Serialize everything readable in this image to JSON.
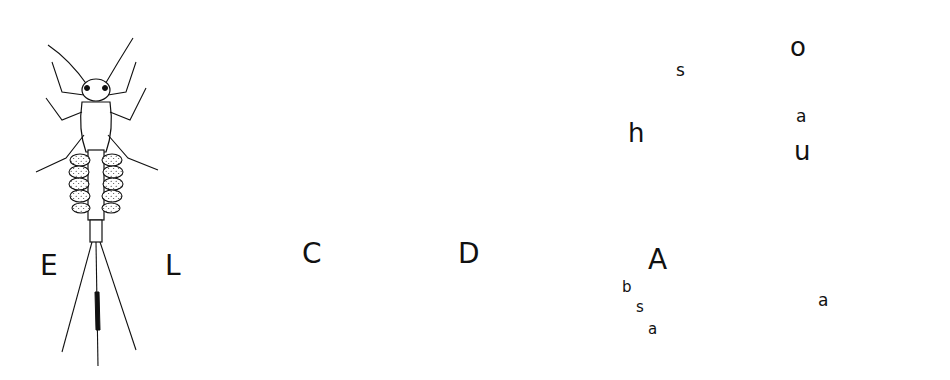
{
  "figure": {
    "colors": {
      "ink": "#111111",
      "paper": "#ffffff"
    },
    "specimens": [
      {
        "id": "E",
        "label": "E",
        "description": "mayfly nymph with lateral abdominal gills and three tail filaments"
      },
      {
        "id": "L",
        "label": "L",
        "description": "larva with dark dorsal spots on abdominal segments"
      },
      {
        "id": "C",
        "label": "C",
        "description": "damselfly nymph with three leaf-like caudal gills"
      },
      {
        "id": "D",
        "label": "D",
        "description": "larva with coiled internal structure and two tail filaments"
      },
      {
        "id": "A",
        "label": "A",
        "description": "segmented midge-like larva",
        "parts": {
          "h": "h",
          "s_top": "s",
          "b": "b",
          "s_bottom": "s",
          "a": "a"
        }
      }
    ],
    "gill_detail": {
      "top_label": "o",
      "top_a": "a",
      "bottom_label": "u",
      "bottom_a": "a"
    }
  }
}
